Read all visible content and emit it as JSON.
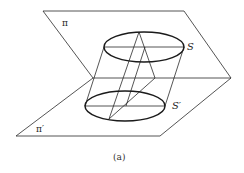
{
  "figure": {
    "caption": "(a)",
    "labels": {
      "plane_top": "π",
      "plane_bottom": "π′",
      "section_top": "S",
      "section_bottom": "S′"
    },
    "colors": {
      "stroke": "#2a2a2a",
      "ellipse_stroke": "#1a1a1a",
      "background": "#ffffff"
    }
  }
}
